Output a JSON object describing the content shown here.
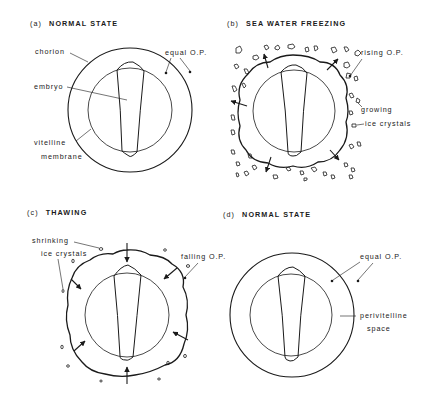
{
  "panels": [
    {
      "id": "a",
      "prefix": "(a)",
      "title": "NORMAL STATE",
      "labels": {
        "chorion": "chorion",
        "embryo": "embryo",
        "vitelline1": "vitelline",
        "vitelline2": "membrane",
        "op": "equal O.P."
      }
    },
    {
      "id": "b",
      "prefix": "(b)",
      "title": "SEA WATER FREEZING",
      "labels": {
        "op": "rising O.P.",
        "ice1": "growing",
        "ice2": "ice crystals"
      }
    },
    {
      "id": "c",
      "prefix": "(c)",
      "title": "THAWING",
      "labels": {
        "ice1": "shrinking",
        "ice2": "ice crystals",
        "op": "falling O.P."
      }
    },
    {
      "id": "d",
      "prefix": "(d)",
      "title": "NORMAL STATE",
      "labels": {
        "op": "equal O.P.",
        "space1": "perivitelline",
        "space2": "space"
      }
    }
  ],
  "colors": {
    "ink": "#1a1a1a",
    "background": "#ffffff"
  }
}
